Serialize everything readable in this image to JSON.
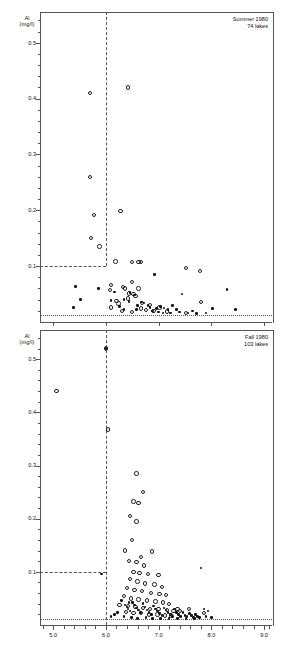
{
  "figure": {
    "type": "scatter-panels",
    "x_axis": {
      "label": "",
      "ticks": [
        "5.0",
        "6.0",
        "7.0",
        "8.0",
        "9.0"
      ],
      "tick_values": [
        5.0,
        6.0,
        7.0,
        8.0,
        9.0
      ],
      "min": 4.75,
      "max": 9.15,
      "minor_step": 0.2
    }
  },
  "panels": [
    {
      "id": "summer",
      "annotation_line1": "Summer 1980",
      "annotation_line2": "74 lakes",
      "y_label_line1": "Al",
      "y_label_line2": "(mg/l)",
      "y_ticks": [
        "0.1",
        "0.2",
        "0.3",
        "0.4",
        "0.5"
      ],
      "y_tick_values": [
        0.1,
        0.2,
        0.3,
        0.4,
        0.5
      ],
      "y_min": 0.0,
      "y_max": 0.555,
      "reference_lines": {
        "vertical_ph": 6.0,
        "horizontal_al": 0.1,
        "baseline_al": 0.012
      }
    },
    {
      "id": "fall",
      "annotation_line1": "Fall 1980",
      "annotation_line2": "103 lakes",
      "y_label_line1": "Al",
      "y_label_line2": "(mg/l)",
      "y_ticks": [
        "0.1",
        "0.2",
        "0.3",
        "0.4",
        "0.5"
      ],
      "y_tick_values": [
        0.1,
        0.2,
        0.3,
        0.4,
        0.5
      ],
      "y_min": 0.0,
      "y_max": 0.555,
      "reference_lines": {
        "vertical_ph": 6.0,
        "horizontal_al": 0.1,
        "baseline_al": 0.012
      }
    }
  ],
  "chart_data": [
    {
      "type": "scatter",
      "title": "Summer 1980",
      "subtitle": "74 lakes",
      "xlabel": "pH",
      "ylabel": "Al (mg/l)",
      "xlim": [
        4.75,
        9.15
      ],
      "ylim": [
        0.0,
        0.555
      ],
      "grid": false,
      "legend": "none",
      "series": [
        {
          "name": "open-circle",
          "marker": "open circle",
          "points": [
            [
              5.7,
              0.41
            ],
            [
              5.7,
              0.26
            ],
            [
              5.78,
              0.192
            ],
            [
              5.72,
              0.15
            ],
            [
              5.88,
              0.135
            ],
            [
              6.42,
              0.42
            ],
            [
              6.28,
              0.199
            ],
            [
              6.18,
              0.108
            ],
            [
              6.5,
              0.107
            ],
            [
              6.62,
              0.107
            ],
            [
              6.66,
              0.107
            ],
            [
              7.52,
              0.097
            ],
            [
              7.78,
              0.091
            ],
            [
              6.1,
              0.066
            ],
            [
              6.32,
              0.063
            ],
            [
              6.5,
              0.072
            ],
            [
              6.62,
              0.06
            ],
            [
              6.08,
              0.057
            ],
            [
              6.36,
              0.06
            ],
            [
              6.44,
              0.051
            ],
            [
              6.52,
              0.05
            ],
            [
              6.2,
              0.038
            ],
            [
              6.24,
              0.033
            ],
            [
              6.42,
              0.042
            ],
            [
              6.56,
              0.046
            ],
            [
              6.68,
              0.034
            ],
            [
              6.84,
              0.03
            ],
            [
              6.1,
              0.026
            ],
            [
              6.3,
              0.02
            ],
            [
              6.66,
              0.024
            ],
            [
              6.76,
              0.022
            ],
            [
              6.9,
              0.02
            ],
            [
              7.02,
              0.026
            ],
            [
              7.16,
              0.019
            ],
            [
              7.52,
              0.016
            ],
            [
              7.8,
              0.036
            ],
            [
              6.5,
              0.018
            ]
          ]
        },
        {
          "name": "filled-dot",
          "marker": "filled dot",
          "points": [
            [
              6.92,
              0.085
            ],
            [
              5.42,
              0.064
            ],
            [
              5.86,
              0.06
            ],
            [
              8.3,
              0.058
            ],
            [
              7.44,
              0.05
            ],
            [
              6.16,
              0.054
            ],
            [
              6.46,
              0.053
            ],
            [
              6.54,
              0.048
            ],
            [
              5.52,
              0.04
            ],
            [
              6.1,
              0.038
            ],
            [
              6.34,
              0.04
            ],
            [
              6.44,
              0.037
            ],
            [
              6.68,
              0.036
            ],
            [
              6.72,
              0.034
            ],
            [
              6.8,
              0.03
            ],
            [
              5.38,
              0.026
            ],
            [
              6.26,
              0.028
            ],
            [
              6.6,
              0.03
            ],
            [
              6.84,
              0.026
            ],
            [
              6.96,
              0.024
            ],
            [
              7.04,
              0.028
            ],
            [
              7.1,
              0.025
            ],
            [
              7.18,
              0.022
            ],
            [
              7.26,
              0.03
            ],
            [
              7.34,
              0.022
            ],
            [
              6.88,
              0.02
            ],
            [
              7.0,
              0.018
            ],
            [
              7.08,
              0.016
            ],
            [
              7.4,
              0.018
            ],
            [
              7.56,
              0.016
            ],
            [
              7.64,
              0.02
            ],
            [
              7.72,
              0.015
            ],
            [
              7.9,
              0.016
            ],
            [
              8.02,
              0.024
            ],
            [
              8.46,
              0.022
            ],
            [
              6.58,
              0.022
            ],
            [
              7.22,
              0.016
            ],
            [
              6.34,
              0.022
            ]
          ]
        }
      ],
      "reference_lines": [
        {
          "kind": "vertical",
          "x": 6.0,
          "style": "dashed",
          "from_y": 0.1,
          "to_y": 0.555
        },
        {
          "kind": "horizontal",
          "y": 0.1,
          "style": "dashed",
          "from_x": 4.75,
          "to_x": 6.0
        },
        {
          "kind": "horizontal",
          "y": 0.012,
          "style": "dotted",
          "from_x": 4.75,
          "to_x": 9.15
        }
      ]
    },
    {
      "type": "scatter",
      "title": "Fall 1980",
      "subtitle": "103 lakes",
      "xlabel": "pH",
      "ylabel": "Al (mg/l)",
      "xlim": [
        4.75,
        9.15
      ],
      "ylim": [
        0.0,
        0.555
      ],
      "grid": false,
      "legend": "none",
      "series": [
        {
          "name": "open-circle",
          "marker": "open circle",
          "points": [
            [
              6.0,
              0.52
            ],
            [
              5.06,
              0.44
            ],
            [
              6.04,
              0.368
            ],
            [
              6.58,
              0.285
            ],
            [
              6.7,
              0.25
            ],
            [
              6.52,
              0.232
            ],
            [
              6.62,
              0.23
            ],
            [
              6.46,
              0.205
            ],
            [
              6.58,
              0.195
            ],
            [
              6.5,
              0.16
            ],
            [
              6.36,
              0.14
            ],
            [
              6.88,
              0.138
            ],
            [
              6.66,
              0.128
            ],
            [
              6.44,
              0.12
            ],
            [
              6.58,
              0.118
            ],
            [
              6.72,
              0.112
            ],
            [
              6.52,
              0.1
            ],
            [
              6.64,
              0.098
            ],
            [
              6.8,
              0.096
            ],
            [
              7.0,
              0.094
            ],
            [
              6.46,
              0.086
            ],
            [
              6.6,
              0.082
            ],
            [
              6.74,
              0.078
            ],
            [
              6.92,
              0.076
            ],
            [
              7.06,
              0.072
            ],
            [
              6.4,
              0.07
            ],
            [
              6.54,
              0.066
            ],
            [
              6.68,
              0.064
            ],
            [
              6.86,
              0.06
            ],
            [
              7.02,
              0.058
            ],
            [
              7.14,
              0.056
            ],
            [
              6.34,
              0.054
            ],
            [
              6.48,
              0.05
            ],
            [
              6.62,
              0.048
            ],
            [
              6.78,
              0.046
            ],
            [
              6.94,
              0.044
            ],
            [
              7.08,
              0.042
            ],
            [
              7.2,
              0.04
            ],
            [
              6.26,
              0.038
            ],
            [
              6.42,
              0.036
            ],
            [
              6.56,
              0.034
            ],
            [
              6.7,
              0.032
            ],
            [
              6.84,
              0.03
            ],
            [
              7.0,
              0.03
            ],
            [
              7.16,
              0.028
            ],
            [
              7.28,
              0.026
            ],
            [
              7.4,
              0.026
            ],
            [
              6.38,
              0.024
            ],
            [
              6.52,
              0.022
            ],
            [
              6.66,
              0.022
            ],
            [
              6.82,
              0.02
            ],
            [
              6.98,
              0.02
            ],
            [
              7.12,
              0.018
            ],
            [
              7.24,
              0.018
            ],
            [
              7.36,
              0.03
            ],
            [
              7.58,
              0.03
            ],
            [
              7.86,
              0.022
            ]
          ]
        },
        {
          "name": "filled-dot",
          "marker": "filled dot",
          "points": [
            [
              6.0,
              0.52
            ],
            [
              7.8,
              0.107
            ],
            [
              5.92,
              0.096
            ],
            [
              7.86,
              0.03
            ],
            [
              7.94,
              0.026
            ],
            [
              6.3,
              0.046
            ],
            [
              6.44,
              0.042
            ],
            [
              6.36,
              0.038
            ],
            [
              6.4,
              0.034
            ],
            [
              6.42,
              0.03
            ],
            [
              6.46,
              0.026
            ],
            [
              6.5,
              0.042
            ],
            [
              6.54,
              0.038
            ],
            [
              6.58,
              0.032
            ],
            [
              6.62,
              0.028
            ],
            [
              6.66,
              0.024
            ],
            [
              6.7,
              0.04
            ],
            [
              6.74,
              0.034
            ],
            [
              6.78,
              0.028
            ],
            [
              6.82,
              0.024
            ],
            [
              6.86,
              0.02
            ],
            [
              6.9,
              0.036
            ],
            [
              6.94,
              0.03
            ],
            [
              6.98,
              0.026
            ],
            [
              7.02,
              0.022
            ],
            [
              7.06,
              0.018
            ],
            [
              7.1,
              0.032
            ],
            [
              7.14,
              0.028
            ],
            [
              7.18,
              0.024
            ],
            [
              7.22,
              0.02
            ],
            [
              7.26,
              0.016
            ],
            [
              7.3,
              0.03
            ],
            [
              7.34,
              0.024
            ],
            [
              7.38,
              0.02
            ],
            [
              7.42,
              0.016
            ],
            [
              7.46,
              0.024
            ],
            [
              7.5,
              0.018
            ],
            [
              7.54,
              0.016
            ],
            [
              7.58,
              0.022
            ],
            [
              7.62,
              0.018
            ],
            [
              7.66,
              0.014
            ],
            [
              7.7,
              0.02
            ],
            [
              7.74,
              0.016
            ],
            [
              7.78,
              0.014
            ],
            [
              6.22,
              0.024
            ],
            [
              6.16,
              0.02
            ],
            [
              6.1,
              0.016
            ],
            [
              7.9,
              0.016
            ],
            [
              8.0,
              0.014
            ],
            [
              6.34,
              0.016
            ],
            [
              6.48,
              0.014
            ],
            [
              6.6,
              0.012
            ],
            [
              6.76,
              0.014
            ],
            [
              6.88,
              0.012
            ],
            [
              7.04,
              0.012
            ],
            [
              7.2,
              0.012
            ],
            [
              7.36,
              0.012
            ],
            [
              7.52,
              0.012
            ],
            [
              7.68,
              0.012
            ]
          ]
        }
      ],
      "reference_lines": [
        {
          "kind": "vertical",
          "x": 6.0,
          "style": "dashed",
          "from_y": 0.0,
          "to_y": 0.555
        },
        {
          "kind": "horizontal",
          "y": 0.1,
          "style": "dashed",
          "from_x": 4.75,
          "to_x": 6.0
        },
        {
          "kind": "horizontal",
          "y": 0.012,
          "style": "dotted",
          "from_x": 4.75,
          "to_x": 9.15
        }
      ]
    }
  ]
}
